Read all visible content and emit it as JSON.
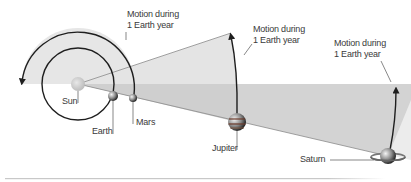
{
  "labels": {
    "sun": "Sun",
    "earth": "Earth",
    "mars": "Mars",
    "jupiter": "Jupiter",
    "saturn": "Saturn"
  },
  "motion_labels": [
    {
      "line1": "Motion during",
      "line2": "1 Earth year",
      "for": "mars"
    },
    {
      "line1": "Motion during",
      "line2": "1 Earth year",
      "for": "jupiter"
    },
    {
      "line1": "Motion during",
      "line2": "1 Earth year",
      "for": "saturn"
    }
  ],
  "colors": {
    "light_fill": "#e9e9e9",
    "dark_fill": "#d2d2d2",
    "orbit_stroke": "#1e1e1e",
    "leader": "#555555"
  }
}
